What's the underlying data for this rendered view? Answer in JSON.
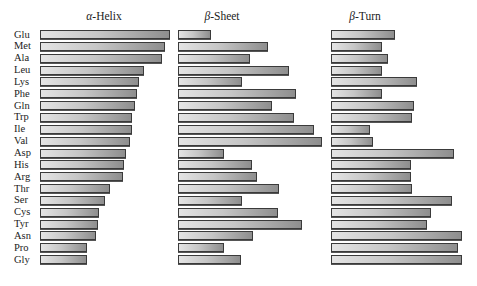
{
  "chart_data": {
    "type": "bar",
    "orientation": "horizontal",
    "title": "",
    "xlabel": "",
    "ylabel": "",
    "grid": false,
    "legend": "none",
    "categories": [
      "Glu",
      "Met",
      "Ala",
      "Leu",
      "Lys",
      "Phe",
      "Gln",
      "Trp",
      "Ile",
      "Val",
      "Asp",
      "His",
      "Arg",
      "Thr",
      "Ser",
      "Cys",
      "Tyr",
      "Asn",
      "Pro",
      "Gly"
    ],
    "panels": [
      {
        "greek": "α",
        "title_rest": "-Helix",
        "title": "α-Helix",
        "left_px": 40,
        "lengths_px": [
          130,
          125,
          122,
          104,
          99,
          97,
          95,
          92,
          92,
          90,
          86,
          84,
          83,
          70,
          65,
          59,
          58,
          56,
          47,
          47
        ]
      },
      {
        "greek": "β",
        "title_rest": "-Sheet",
        "title": "β-Sheet",
        "left_px": 178,
        "lengths_px": [
          33,
          90,
          72,
          111,
          64,
          118,
          94,
          116,
          136,
          144,
          46,
          74,
          79,
          101,
          64,
          100,
          124,
          75,
          46,
          63
        ]
      },
      {
        "greek": "β",
        "title_rest": "-Turn",
        "title": "β-Turn",
        "left_px": 331,
        "lengths_px": [
          64,
          51,
          57,
          51,
          86,
          51,
          83,
          81,
          39,
          42,
          123,
          80,
          80,
          81,
          121,
          100,
          96,
          131,
          127,
          131
        ]
      }
    ],
    "layout": {
      "first_row_top_px": 30,
      "row_pitch_px": 11.85,
      "bar_height_px": 10
    }
  }
}
